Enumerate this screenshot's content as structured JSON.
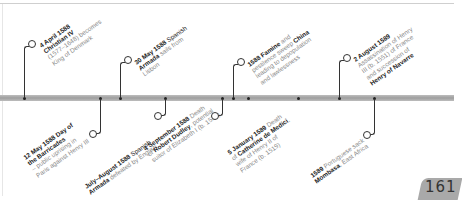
{
  "timeline": {
    "events_above": [
      {
        "date": "4 April 1588",
        "text_bold": "Christian IV",
        "text": "(1577–1648) becomes King of Denmark",
        "lines": [
          "4 April 1588",
          "Christian IV",
          "(1577–1648) becomes",
          "King of Denmark"
        ]
      },
      {
        "date": "30 May 1588",
        "text": "Spanish Armada sails from Lisbon",
        "lines": [
          "30 May 1588 Spanish",
          "Armada sails from",
          "Lisbon"
        ]
      },
      {
        "date": "1588",
        "text": "Famine and pestilence sweep China leading to depopulation and lawlessness",
        "lines": [
          "1588 Famine and",
          "pestilence sweep China",
          "leading to depopulation",
          "and lawlessness"
        ]
      },
      {
        "date": "2 August 1589",
        "text": "Assassination of Henry III (b. 1551) of France and succession of Henry of Navarre",
        "lines": [
          "2 August 1589",
          "Assassination of Henry",
          "III (b. 1551) of France",
          "and succession of",
          "Henry of Navarre"
        ]
      }
    ],
    "events_below": [
      {
        "date": "12 May 1588",
        "text": "Day of the Barricades – public uprising in Paris against Henry III",
        "lines": [
          "12 May 1588 Day of",
          "the Barricades",
          "– public uprising in",
          "Paris against Henry III"
        ]
      },
      {
        "date": "July–August 1588",
        "text": "Spanish Armada defeated by English",
        "lines": [
          "July–August 1588 Spanish",
          "Armada defeated by English"
        ]
      },
      {
        "date": "4 September 1588",
        "text": "Death of Robert Dudley, potential suitor of Elizabeth I (b. 1532)",
        "lines": [
          "4 September 1588 Death",
          "of Robert Dudley, potential",
          "suitor of Elizabeth I (b. 1532)"
        ]
      },
      {
        "date": "5 January 1589",
        "text": "Death of Catherine de Medici, wife of Henry II of France (b. 1519)",
        "lines": [
          "5 January 1589 Death",
          "of Catherine de Medici,",
          "wife of Henry II of",
          "France (b. 1519)"
        ]
      },
      {
        "date": "1589",
        "text": "Portuguese sack Mombasa, East Africa",
        "lines": [
          "1589 Portuguese sack",
          "Mombasa, East Africa"
        ]
      }
    ]
  },
  "page_number": "161",
  "colors": {
    "bar": "#a8a8a8",
    "bold_text": "#1a1a1a",
    "body_text": "#8a8a8a",
    "page_tab": "#a9a9a9"
  }
}
